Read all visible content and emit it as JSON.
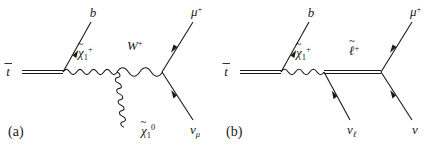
{
  "figure": {
    "type": "feynman-diagrams",
    "panel_count": 2,
    "background_color": "#ffffff",
    "line_color": "#1a1a1a"
  },
  "panels": [
    {
      "id": "a",
      "caption": "(a)",
      "description": "Top antiquark decay via chargino and W boson",
      "labels": {
        "incoming": "t",
        "incoming_bar": true,
        "b_quark": "b",
        "chargino": "χ",
        "chargino_sub": "1",
        "chargino_sup": "+",
        "w_boson": "W",
        "w_boson_sup": "+",
        "neutralino": "χ",
        "neutralino_sub": "1",
        "neutralino_sup": "0",
        "muon": "μ",
        "muon_sup": "+",
        "neutrino": "ν",
        "neutrino_sub": "μ"
      },
      "propagators": [
        {
          "name": "chargino-wavy",
          "style": "zigzag"
        },
        {
          "name": "w-boson-wave",
          "style": "sine"
        },
        {
          "name": "neutralino-coil",
          "style": "helix"
        }
      ]
    },
    {
      "id": "b",
      "caption": "(b)",
      "description": "Top antiquark decay via chargino and slepton",
      "labels": {
        "incoming": "t",
        "incoming_bar": true,
        "b_quark": "b",
        "chargino": "χ",
        "chargino_sub": "1",
        "chargino_sup": "+",
        "slepton": "ℓ",
        "slepton_sup": "+",
        "neutrino_lepton": "ν",
        "neutrino_lepton_sub": "ℓ",
        "muon": "μ",
        "muon_sup": "+",
        "neutrino": "ν"
      },
      "propagators": [
        {
          "name": "chargino-wavy",
          "style": "zigzag"
        },
        {
          "name": "slepton-double-line",
          "style": "double"
        }
      ]
    }
  ]
}
